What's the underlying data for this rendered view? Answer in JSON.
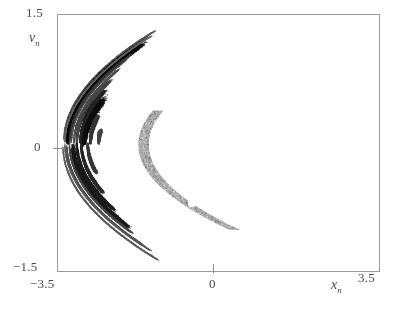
{
  "figure": {
    "kind": "phase-portrait",
    "background_color": "#ffffff",
    "frame_color": "#9a9a9a"
  },
  "axes": {
    "x": {
      "name": "x",
      "subscript": "n",
      "min_label": "−3.5",
      "mid_label": "0",
      "max_label": "3.5",
      "min": -3.5,
      "max": 3.5
    },
    "y": {
      "name": "v",
      "subscript": "n",
      "min_label": "−1.5",
      "mid_label": "0",
      "max_label": "1.5",
      "min": -1.5,
      "max": 1.5
    }
  },
  "markers": [
    {
      "label": "upper-white-dot",
      "x": 0.55,
      "y": 0.66,
      "radius_px": 4.0,
      "color": "#ffffff"
    },
    {
      "label": "lower-white-dot",
      "x": -0.57,
      "y": -0.7,
      "radius_px": 4.0,
      "color": "#ffffff"
    }
  ],
  "chart_data": {
    "type": "scatter",
    "title": "",
    "subtitle": "",
    "xlabel": "x_n",
    "ylabel": "v_n",
    "xlim": [
      -3.5,
      3.5
    ],
    "ylim": [
      -1.5,
      1.5
    ],
    "xticks": [
      -3.5,
      0,
      3.5
    ],
    "xticklabels": [
      "−3.5",
      "0",
      "3.5"
    ],
    "yticks": [
      -1.5,
      0,
      1.5
    ],
    "yticklabels": [
      "−1.5",
      "0",
      "1.5"
    ],
    "grid": false,
    "legend": "none",
    "annotations": [
      {
        "text": "white dot",
        "x": 0.55,
        "y": 0.66
      },
      {
        "text": "white dot",
        "x": -0.57,
        "y": -0.7
      }
    ],
    "bands": [
      {
        "name": "outer-thin-upper",
        "apex_x": -3.38,
        "apex_y": 0.02,
        "curvature": 0.255,
        "offset": 1.29,
        "thickness": 0.022,
        "density": 0.26,
        "shade": "#5a5a5a"
      },
      {
        "name": "outer-thin-upper-2",
        "apex_x": -3.34,
        "apex_y": 0.02,
        "curvature": 0.25,
        "offset": 1.21,
        "thickness": 0.026,
        "density": 0.3,
        "shade": "#4c4c4c"
      },
      {
        "name": "dense-black-upper",
        "apex_x": -3.3,
        "apex_y": 0.01,
        "curvature": 0.246,
        "offset": 1.1,
        "thickness": 0.072,
        "density": 0.95,
        "shade": "#0b0b0b"
      },
      {
        "name": "inner-gray-upper",
        "apex_x": -3.22,
        "apex_y": 0.01,
        "curvature": 0.238,
        "offset": 0.96,
        "thickness": 0.03,
        "density": 0.34,
        "shade": "#585858"
      },
      {
        "name": "mid-gray",
        "apex_x": -3.1,
        "apex_y": 0.0,
        "curvature": 0.222,
        "offset": 0.72,
        "thickness": 0.034,
        "density": 0.4,
        "shade": "#4a4a4a"
      },
      {
        "name": "core-black",
        "apex_x": -2.95,
        "apex_y": 0.0,
        "curvature": 0.206,
        "offset": 0.46,
        "thickness": 0.085,
        "density": 0.92,
        "shade": "#101010"
      },
      {
        "name": "gray-lobe-fill",
        "apex_x": -2.3,
        "apex_y": -0.02,
        "curvature": 0.15,
        "offset": -0.1,
        "thickness": 0.46,
        "density": 0.55,
        "shade": "#8a8a8a"
      },
      {
        "name": "lower-dense-band",
        "apex_x": -3.18,
        "apex_y": -0.02,
        "curvature": 0.232,
        "offset": -0.92,
        "thickness": 0.06,
        "density": 0.78,
        "shade": "#1e1e1e"
      },
      {
        "name": "lower-thin-band",
        "apex_x": -3.32,
        "apex_y": -0.02,
        "curvature": 0.248,
        "offset": -1.16,
        "thickness": 0.028,
        "density": 0.32,
        "shade": "#4f4f4f"
      },
      {
        "name": "lower-outer-band",
        "apex_x": -3.4,
        "apex_y": -0.03,
        "curvature": 0.258,
        "offset": -1.33,
        "thickness": 0.02,
        "density": 0.24,
        "shade": "#606060"
      }
    ]
  }
}
